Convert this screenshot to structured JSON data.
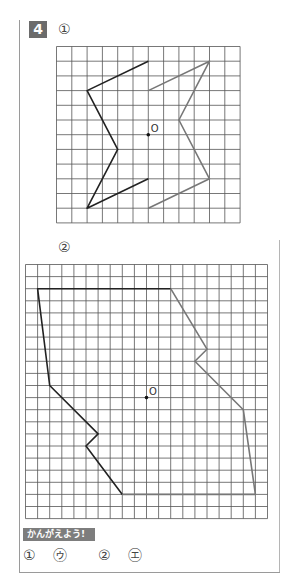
{
  "problem": {
    "number": "4",
    "parts": [
      {
        "label": "①",
        "grid": {
          "cols": 12,
          "rows": 12
        },
        "center_label": "O",
        "center": [
          6,
          6
        ],
        "original_shape": [
          [
            6,
            1
          ],
          [
            2,
            3
          ],
          [
            4,
            7
          ],
          [
            2,
            11
          ],
          [
            6,
            9
          ]
        ],
        "rotated_shape": [
          [
            6,
            3
          ],
          [
            10,
            1
          ],
          [
            8,
            5
          ],
          [
            10,
            9
          ],
          [
            6,
            11
          ]
        ]
      },
      {
        "label": "②",
        "grid": {
          "cols": 20,
          "rows": 21
        },
        "center_label": "O",
        "center": [
          10,
          11
        ],
        "original_shape": [
          [
            12,
            2
          ],
          [
            1,
            2
          ],
          [
            2,
            10
          ],
          [
            6,
            14
          ],
          [
            5,
            15
          ],
          [
            8,
            19
          ]
        ],
        "rotated_shape": [
          [
            12,
            2
          ],
          [
            15,
            7
          ],
          [
            14,
            8
          ],
          [
            18,
            12
          ],
          [
            19,
            19
          ],
          [
            8,
            19
          ]
        ]
      }
    ]
  },
  "hint": {
    "title": "かんがえよう!",
    "answers": [
      {
        "num": "①",
        "choice": "㋒"
      },
      {
        "num": "②",
        "choice": "㋓"
      }
    ]
  },
  "colors": {
    "grid_line": "#555555",
    "original_line": "#222222",
    "rotated_line": "#777777",
    "badge_bg": "#6b6b6b",
    "hint_bg": "#7d7d7d"
  }
}
